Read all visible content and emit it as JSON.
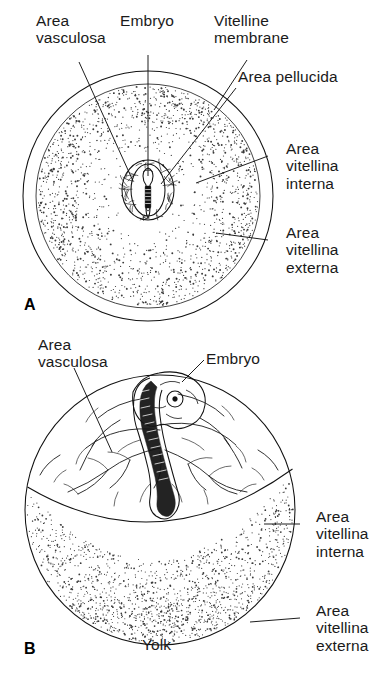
{
  "figure": {
    "background_color": "#ffffff",
    "ink_color": "#111111"
  },
  "panel_a": {
    "id": "A",
    "labels": {
      "area_vasculosa": "Area\nvasculosa",
      "embryo": "Embryo",
      "vitelline_membrane": "Vitelline\nmembrane",
      "area_pellucida": "Area pellucida",
      "area_vitellina_interna": "Area\nvitellina\ninterna",
      "area_vitellina_externa": "Area\nvitellina\nexterna"
    }
  },
  "panel_b": {
    "id": "B",
    "labels": {
      "area_vasculosa": "Area\nvasculosa",
      "embryo": "Embryo",
      "area_vitellina_interna": "Area\nvitellina\ninterna",
      "area_vitellina_externa": "Area\nvitellina\nexterna",
      "yolk": "Yolk"
    }
  }
}
